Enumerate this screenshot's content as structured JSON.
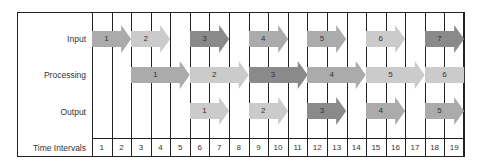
{
  "diagram": {
    "rows": [
      {
        "label": "Input"
      },
      {
        "label": "Processing"
      },
      {
        "label": "Output"
      }
    ],
    "axis_label": "Time Intervals",
    "intervals": [
      "1",
      "2",
      "3",
      "4",
      "5",
      "6",
      "7",
      "8",
      "9",
      "10",
      "11",
      "12",
      "13",
      "14",
      "15",
      "16",
      "17",
      "18",
      "19"
    ],
    "colors": {
      "light": "#cbcbcb",
      "medium": "#ababab",
      "dark": "#8a8a8a",
      "line": "#222222"
    },
    "tasks": {
      "input": [
        {
          "label": "1",
          "start": 1,
          "end": 2,
          "shade": "medium"
        },
        {
          "label": "2",
          "start": 3,
          "end": 4,
          "shade": "light"
        },
        {
          "label": "3",
          "start": 6,
          "end": 7,
          "shade": "dark"
        },
        {
          "label": "4",
          "start": 9,
          "end": 10,
          "shade": "medium"
        },
        {
          "label": "5",
          "start": 12,
          "end": 13,
          "shade": "medium"
        },
        {
          "label": "6",
          "start": 15,
          "end": 16,
          "shade": "light"
        },
        {
          "label": "7",
          "start": 18,
          "end": 19,
          "shade": "dark"
        }
      ],
      "processing": [
        {
          "label": "1",
          "start": 3,
          "end": 5,
          "shade": "medium"
        },
        {
          "label": "2",
          "start": 6,
          "end": 8,
          "shade": "light"
        },
        {
          "label": "3",
          "start": 9,
          "end": 11,
          "shade": "dark"
        },
        {
          "label": "4",
          "start": 12,
          "end": 14,
          "shade": "medium"
        },
        {
          "label": "5",
          "start": 15,
          "end": 17,
          "shade": "light"
        },
        {
          "label": "6",
          "start": 18,
          "end": 19,
          "shade": "light",
          "no_head": true
        }
      ],
      "output": [
        {
          "label": "1",
          "start": 6,
          "end": 7,
          "shade": "light"
        },
        {
          "label": "2",
          "start": 9,
          "end": 10,
          "shade": "light"
        },
        {
          "label": "3",
          "start": 12,
          "end": 13,
          "shade": "dark"
        },
        {
          "label": "4",
          "start": 15,
          "end": 16,
          "shade": "medium"
        },
        {
          "label": "5",
          "start": 18,
          "end": 19,
          "shade": "medium"
        }
      ]
    }
  }
}
